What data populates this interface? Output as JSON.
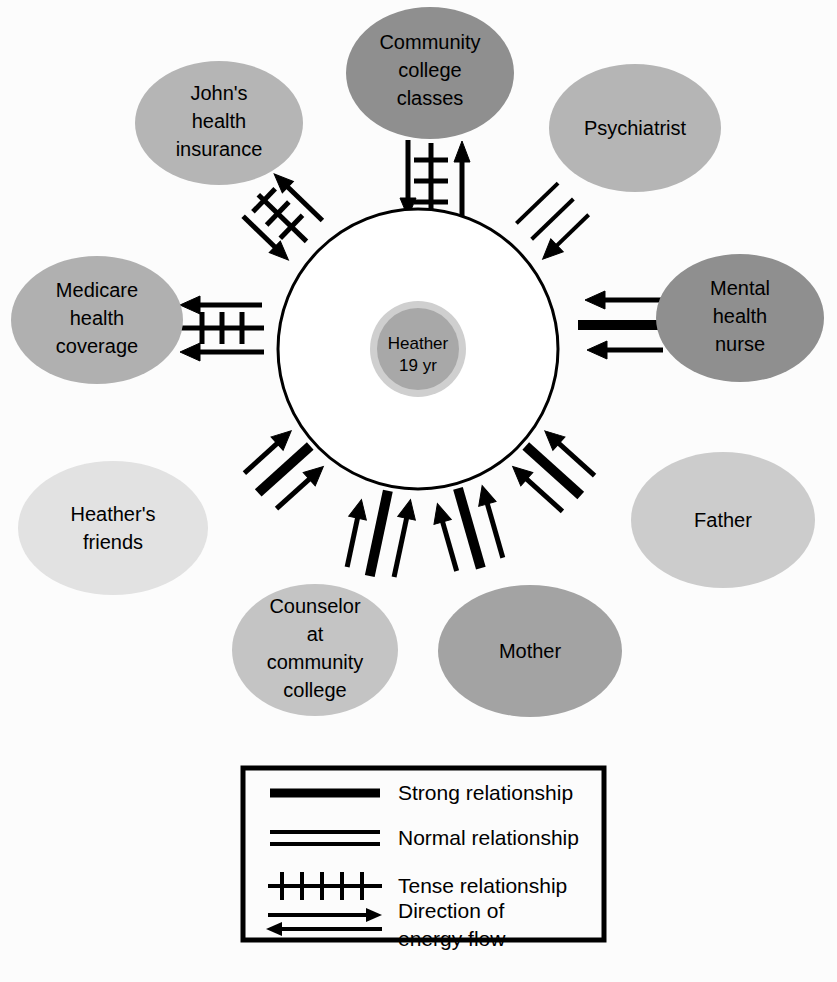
{
  "diagram": {
    "type": "ecomap",
    "title": "",
    "center": {
      "name": "center-node",
      "line1": "Heather",
      "line2": "19 yr",
      "fill": "#a8a8a8",
      "ring_fill": "#cfcfcf"
    },
    "nodes": [
      {
        "id": "community-college-classes",
        "label_lines": [
          "Community",
          "college",
          "classes"
        ],
        "fill": "#8f8f8f",
        "cx": 430,
        "cy": 73,
        "rx": 84,
        "ry": 66,
        "angle_deg": -90,
        "relationship": "tense",
        "energy_flow": "both",
        "arrows": [
          "toward-center",
          "toward-node"
        ]
      },
      {
        "id": "johns-health-insurance",
        "label_lines": [
          "John's",
          "health",
          "insurance"
        ],
        "fill": "#b5b5b5",
        "cx": 219,
        "cy": 123,
        "rx": 84,
        "ry": 62,
        "angle_deg": -136,
        "relationship": "tense",
        "energy_flow": "both",
        "arrows": [
          "toward-center",
          "toward-node"
        ]
      },
      {
        "id": "psychiatrist",
        "label_lines": [
          "Psychiatrist"
        ],
        "fill": "#b5b5b5",
        "cx": 635,
        "cy": 128,
        "rx": 86,
        "ry": 64,
        "angle_deg": -44,
        "relationship": "normal",
        "energy_flow": "toward-center",
        "arrows": [
          "toward-center"
        ]
      },
      {
        "id": "medicare-health-coverage",
        "label_lines": [
          "Medicare",
          "health",
          "coverage"
        ],
        "fill": "#b0b0b0",
        "cx": 97,
        "cy": 320,
        "rx": 86,
        "ry": 64,
        "angle_deg": 180,
        "relationship": "tense",
        "energy_flow": "toward-node",
        "arrows": [
          "toward-node",
          "toward-node"
        ]
      },
      {
        "id": "mental-health-nurse",
        "label_lines": [
          "Mental",
          "health",
          "nurse"
        ],
        "fill": "#8f8f8f",
        "cx": 740,
        "cy": 318,
        "rx": 84,
        "ry": 64,
        "angle_deg": 0,
        "relationship": "strong",
        "energy_flow": "toward-center",
        "arrows": [
          "toward-center",
          "toward-center"
        ]
      },
      {
        "id": "heathers-friends",
        "label_lines": [
          "Heather's",
          "friends"
        ],
        "fill": "#e2e2e2",
        "cx": 113,
        "cy": 528,
        "rx": 95,
        "ry": 67,
        "angle_deg": 138,
        "relationship": "strong",
        "energy_flow": "toward-center",
        "arrows": [
          "toward-center",
          "toward-center"
        ]
      },
      {
        "id": "father",
        "label_lines": [
          "Father"
        ],
        "fill": "#cccccc",
        "cx": 723,
        "cy": 520,
        "rx": 92,
        "ry": 68,
        "angle_deg": 42,
        "relationship": "strong",
        "energy_flow": "toward-center",
        "arrows": [
          "toward-center",
          "toward-center"
        ]
      },
      {
        "id": "counselor-at-community-college",
        "label_lines": [
          "Counselor",
          "at",
          "community",
          "college"
        ],
        "fill": "#c4c4c4",
        "cx": 315,
        "cy": 650,
        "rx": 83,
        "ry": 66,
        "angle_deg": 102,
        "relationship": "strong",
        "energy_flow": "toward-center",
        "arrows": [
          "toward-center",
          "toward-center"
        ]
      },
      {
        "id": "mother",
        "label_lines": [
          "Mother"
        ],
        "fill": "#a3a3a3",
        "cx": 530,
        "cy": 651,
        "rx": 92,
        "ry": 66,
        "angle_deg": 74,
        "relationship": "strong",
        "energy_flow": "toward-center",
        "arrows": [
          "toward-center",
          "toward-center"
        ]
      }
    ]
  },
  "legend": {
    "name": "legend-box",
    "items": [
      {
        "id": "strong",
        "symbol": "thick-line",
        "label": "Strong relationship"
      },
      {
        "id": "normal",
        "symbol": "double-line",
        "label": "Normal relationship"
      },
      {
        "id": "tense",
        "symbol": "hatched-line",
        "label": "Tense relationship"
      },
      {
        "id": "energy",
        "symbol": "double-arrow",
        "label_line1": "Direction of",
        "label_line2": "energy flow"
      }
    ]
  },
  "colors": {
    "stroke": "#000000",
    "background": "#fcfcfc",
    "center_circle_fill": "#ffffff"
  }
}
